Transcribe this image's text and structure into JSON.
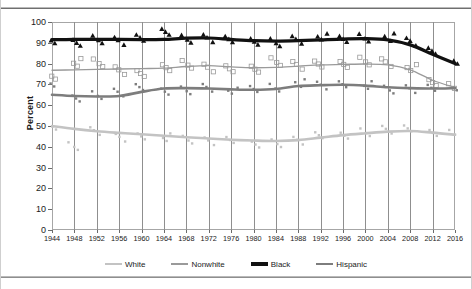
{
  "figure": {
    "title_clipped": "Voter Turnout by Race and Ethnicity",
    "axis": {
      "ylabel": "Percent",
      "xlabel": "",
      "yticks": [
        "0",
        "10",
        "20",
        "30",
        "40",
        "50",
        "60",
        "70",
        "80",
        "90",
        "100"
      ],
      "xticks": [
        "1944",
        "1948",
        "1952",
        "1956",
        "1960",
        "1964",
        "1968",
        "1972",
        "1976",
        "1980",
        "1984",
        "1988",
        "1992",
        "1996",
        "2000",
        "2004",
        "2008",
        "2012",
        "2016"
      ]
    },
    "legend": {
      "position": "bottom",
      "items": [
        {
          "label": "White",
          "color": "#c3c3c3",
          "width": 2.6
        },
        {
          "label": "Nonwhite",
          "color": "#9a9a9a",
          "width": 1.3
        },
        {
          "label": "Black",
          "color": "#111111",
          "width": 3.2
        },
        {
          "label": "Hispanic",
          "color": "#7d7d7d",
          "width": 2.6
        }
      ]
    }
  },
  "chart_data": {
    "type": "line",
    "title": "Voter Turnout by Race and Ethnicity",
    "subtitle": "",
    "xlabel": "",
    "ylabel": "Percent",
    "xlim": [
      1944,
      2016
    ],
    "ylim": [
      0,
      100
    ],
    "grid": "vertical",
    "legend_position": "bottom",
    "x": [
      1944,
      1948,
      1952,
      1956,
      1960,
      1964,
      1968,
      1972,
      1976,
      1980,
      1984,
      1988,
      1992,
      1996,
      2000,
      2004,
      2008,
      2012,
      2016
    ],
    "series": [
      {
        "name": "White",
        "color": "#c3c3c3",
        "marker": "small-square",
        "trend": [
          50.0,
          48.6,
          47.5,
          46.7,
          46.0,
          45.3,
          44.6,
          44.0,
          43.4,
          43.0,
          42.8,
          43.2,
          44.4,
          45.6,
          46.5,
          47.3,
          47.6,
          46.8,
          45.8
        ],
        "values": [
          50,
          40,
          47,
          45,
          45,
          44,
          44,
          43,
          43,
          42,
          42,
          43,
          45,
          46,
          47,
          48,
          48,
          47,
          46
        ]
      },
      {
        "name": "Nonwhite",
        "color": "#9a9a9a",
        "marker": "open-square",
        "trend": [
          76.8,
          77.0,
          77.2,
          77.4,
          77.6,
          77.8,
          78.6,
          79.0,
          78.4,
          78.0,
          78.2,
          78.8,
          79.4,
          79.6,
          79.8,
          79.4,
          77.0,
          72.0,
          68.5
        ],
        "values": [
          74,
          80,
          81,
          77,
          75,
          79,
          80,
          78,
          77,
          78,
          81,
          79,
          79,
          80,
          81,
          80,
          77,
          71,
          68
        ]
      },
      {
        "name": "Black",
        "color": "#111111",
        "marker": "filled-triangle",
        "trend": [
          91.5,
          91.6,
          91.7,
          91.6,
          91.5,
          91.6,
          92.2,
          92.3,
          91.6,
          91.0,
          90.8,
          91.0,
          91.4,
          91.8,
          92.0,
          91.4,
          89.0,
          84.5,
          80.0
        ],
        "values": [
          91,
          91,
          92,
          91,
          92,
          96,
          92,
          92,
          91,
          91,
          90,
          91,
          92,
          92,
          92,
          92,
          91,
          86,
          81
        ]
      },
      {
        "name": "Hispanic",
        "color": "#7d7d7d",
        "marker": "small-square",
        "trend": [
          65.0,
          64.4,
          64.2,
          64.4,
          66.4,
          68.0,
          68.2,
          68.0,
          67.6,
          67.4,
          67.8,
          69.2,
          69.6,
          69.8,
          69.4,
          68.6,
          68.2,
          68.0,
          68.2
        ],
        "values": [
          70,
          64,
          65,
          66,
          68,
          67,
          67,
          68,
          66,
          68,
          68,
          70,
          70,
          70,
          69,
          68,
          68,
          68,
          68
        ]
      }
    ]
  }
}
